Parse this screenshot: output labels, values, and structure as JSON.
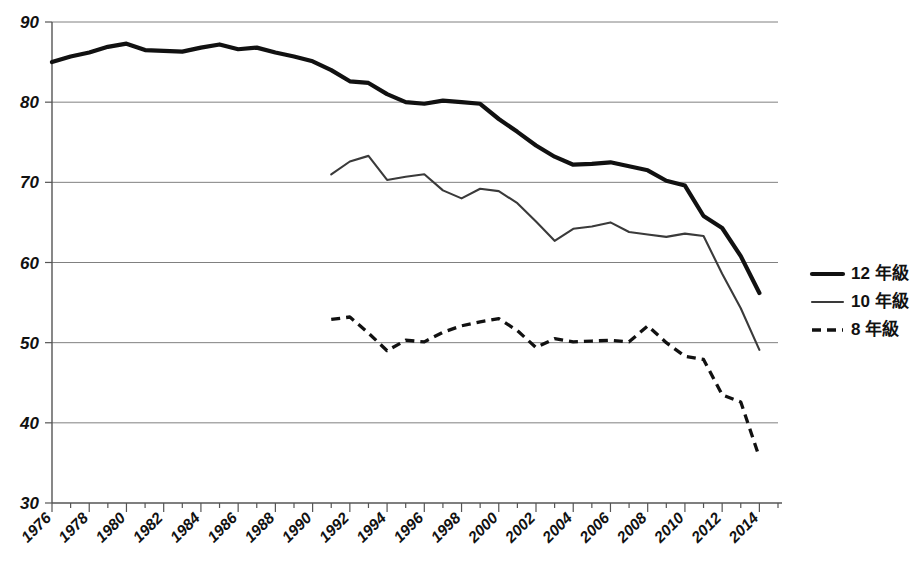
{
  "chart_data": {
    "type": "line",
    "title": "",
    "subtitle": "",
    "xlabel": "",
    "ylabel": "",
    "xlim": [
      1976,
      2015
    ],
    "ylim": [
      30,
      90
    ],
    "yticks": [
      30,
      40,
      50,
      60,
      70,
      80,
      90
    ],
    "grid": true,
    "grid_axis": "y",
    "legend_position": "right",
    "x_tick_labels": [
      "1976",
      "1978",
      "1980",
      "1982",
      "1984",
      "1986",
      "1988",
      "1990",
      "1992",
      "1994",
      "1996",
      "1998",
      "2000",
      "2002",
      "2004",
      "2006",
      "2008",
      "2010",
      "2012",
      "2014"
    ],
    "x_tick_label_rotation": -45,
    "x_minor_tick_every": 1,
    "series": [
      {
        "name": "12 年級",
        "style": "solid-thick",
        "color": "#111111",
        "x": [
          1976,
          1977,
          1978,
          1979,
          1980,
          1981,
          1982,
          1983,
          1984,
          1985,
          1986,
          1987,
          1988,
          1989,
          1990,
          1991,
          1992,
          1993,
          1994,
          1995,
          1996,
          1997,
          1998,
          1999,
          2000,
          2001,
          2002,
          2003,
          2004,
          2005,
          2006,
          2007,
          2008,
          2009,
          2010,
          2011,
          2012,
          2013,
          2014
        ],
        "values": [
          85.0,
          85.7,
          86.2,
          86.9,
          87.3,
          86.5,
          86.4,
          86.3,
          86.8,
          87.2,
          86.6,
          86.8,
          86.2,
          85.7,
          85.1,
          84.0,
          82.6,
          82.4,
          81.0,
          80.0,
          79.8,
          80.2,
          80.0,
          79.8,
          77.9,
          76.3,
          74.6,
          73.2,
          72.2,
          72.3,
          72.5,
          72.0,
          71.5,
          70.2,
          69.6,
          65.8,
          64.3,
          60.8,
          56.2
        ]
      },
      {
        "name": "10 年級",
        "style": "solid-thin",
        "color": "#3a3a3a",
        "x": [
          1991,
          1992,
          1993,
          1994,
          1995,
          1996,
          1997,
          1998,
          1999,
          2000,
          2001,
          2002,
          2003,
          2004,
          2005,
          2006,
          2007,
          2008,
          2009,
          2010,
          2011,
          2012,
          2013,
          2014
        ],
        "values": [
          71.0,
          72.6,
          73.3,
          70.3,
          70.7,
          71.0,
          69.0,
          68.0,
          69.2,
          68.9,
          67.4,
          65.1,
          62.7,
          64.2,
          64.5,
          65.0,
          63.8,
          63.5,
          63.2,
          63.6,
          63.3,
          58.6,
          54.3,
          49.1
        ]
      },
      {
        "name": "8 年級",
        "style": "dashed",
        "color": "#111111",
        "x": [
          1991,
          1992,
          1993,
          1994,
          1995,
          1996,
          1997,
          1998,
          1999,
          2000,
          2001,
          2002,
          2003,
          2004,
          2005,
          2006,
          2007,
          2008,
          2009,
          2010,
          2011,
          2012,
          2013,
          2014
        ],
        "values": [
          52.9,
          53.2,
          51.2,
          49.0,
          50.3,
          50.1,
          51.3,
          52.1,
          52.6,
          53.0,
          51.5,
          49.4,
          50.5,
          50.1,
          50.2,
          50.3,
          50.1,
          52.1,
          50.0,
          48.3,
          47.9,
          43.5,
          42.6,
          35.7
        ]
      }
    ]
  },
  "legend": {
    "items": [
      {
        "label": "12 年級",
        "style": "solid-thick"
      },
      {
        "label": "10 年級",
        "style": "solid-thin"
      },
      {
        "label": "8 年級",
        "style": "dashed"
      }
    ]
  },
  "colors": {
    "grade12": "#111111",
    "grade10": "#3a3a3a",
    "grade8": "#111111",
    "gridline": "#808080",
    "axis": "#555555",
    "background": "#ffffff"
  }
}
